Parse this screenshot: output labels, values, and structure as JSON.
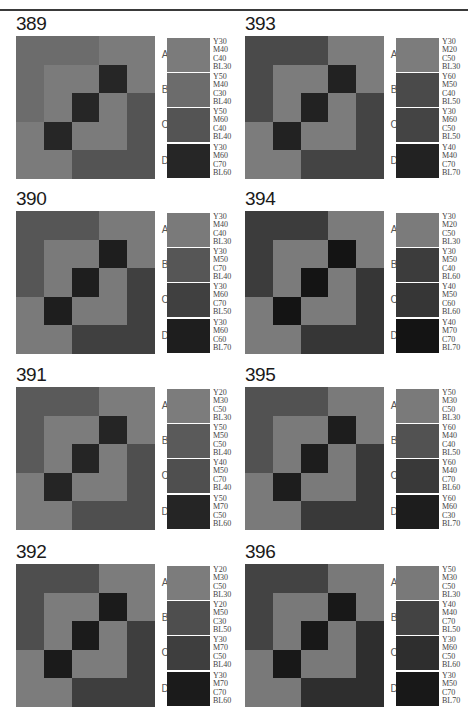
{
  "grid_pattern": [
    [
      "B",
      "B",
      "B",
      "A",
      "A"
    ],
    [
      "B",
      "A",
      "A",
      "D",
      "A"
    ],
    [
      "B",
      "A",
      "D",
      "A",
      "C"
    ],
    [
      "A",
      "D",
      "A",
      "A",
      "C"
    ],
    [
      "A",
      "A",
      "C",
      "C",
      "C"
    ]
  ],
  "panels": [
    {
      "number": "389",
      "col": 0,
      "row": 0,
      "swatches": [
        {
          "letter": "A",
          "color": "#7b7b7b",
          "spec": [
            "Y30",
            "M40",
            "C40",
            "BL30"
          ]
        },
        {
          "letter": "B",
          "color": "#6c6c6c",
          "spec": [
            "Y50",
            "M40",
            "C30",
            "BL40"
          ]
        },
        {
          "letter": "C",
          "color": "#545454",
          "spec": [
            "Y50",
            "M60",
            "C40",
            "BL40"
          ]
        },
        {
          "letter": "D",
          "color": "#262626",
          "spec": [
            "Y30",
            "M60",
            "C70",
            "BL60"
          ]
        }
      ]
    },
    {
      "number": "390",
      "col": 0,
      "row": 1,
      "swatches": [
        {
          "letter": "A",
          "color": "#7a7a7a",
          "spec": [
            "Y30",
            "M40",
            "C40",
            "BL30"
          ]
        },
        {
          "letter": "B",
          "color": "#565656",
          "spec": [
            "Y30",
            "M50",
            "C70",
            "BL40"
          ]
        },
        {
          "letter": "C",
          "color": "#404040",
          "spec": [
            "Y30",
            "M60",
            "C70",
            "BL50"
          ]
        },
        {
          "letter": "D",
          "color": "#1e1e1e",
          "spec": [
            "Y30",
            "M60",
            "C60",
            "BL70"
          ]
        }
      ]
    },
    {
      "number": "391",
      "col": 0,
      "row": 2,
      "swatches": [
        {
          "letter": "A",
          "color": "#7c7c7c",
          "spec": [
            "Y20",
            "M30",
            "C50",
            "BL30"
          ]
        },
        {
          "letter": "B",
          "color": "#5a5a5a",
          "spec": [
            "Y50",
            "M50",
            "C50",
            "BL40"
          ]
        },
        {
          "letter": "C",
          "color": "#4f4f4f",
          "spec": [
            "Y40",
            "M50",
            "C70",
            "BL40"
          ]
        },
        {
          "letter": "D",
          "color": "#252525",
          "spec": [
            "Y50",
            "M70",
            "C50",
            "BL60"
          ]
        }
      ]
    },
    {
      "number": "392",
      "col": 0,
      "row": 3,
      "swatches": [
        {
          "letter": "A",
          "color": "#7c7c7c",
          "spec": [
            "Y20",
            "M30",
            "C50",
            "BL30"
          ]
        },
        {
          "letter": "B",
          "color": "#4e4e4e",
          "spec": [
            "Y20",
            "M50",
            "C30",
            "BL50"
          ]
        },
        {
          "letter": "C",
          "color": "#3e3e3e",
          "spec": [
            "Y30",
            "M70",
            "C50",
            "BL40"
          ]
        },
        {
          "letter": "D",
          "color": "#1b1b1b",
          "spec": [
            "Y30",
            "M70",
            "C70",
            "BL60"
          ]
        }
      ]
    },
    {
      "number": "393",
      "col": 1,
      "row": 0,
      "swatches": [
        {
          "letter": "A",
          "color": "#7c7c7c",
          "spec": [
            "Y30",
            "M20",
            "C50",
            "BL30"
          ]
        },
        {
          "letter": "B",
          "color": "#4a4a4a",
          "spec": [
            "Y60",
            "M50",
            "C40",
            "BL50"
          ]
        },
        {
          "letter": "C",
          "color": "#444444",
          "spec": [
            "Y30",
            "M60",
            "C50",
            "BL50"
          ]
        },
        {
          "letter": "D",
          "color": "#222222",
          "spec": [
            "Y40",
            "M40",
            "C70",
            "BL70"
          ]
        }
      ]
    },
    {
      "number": "394",
      "col": 1,
      "row": 1,
      "swatches": [
        {
          "letter": "A",
          "color": "#7b7b7b",
          "spec": [
            "Y30",
            "M20",
            "C50",
            "BL30"
          ]
        },
        {
          "letter": "B",
          "color": "#3c3c3c",
          "spec": [
            "Y30",
            "M50",
            "C40",
            "BL60"
          ]
        },
        {
          "letter": "C",
          "color": "#363636",
          "spec": [
            "Y40",
            "M50",
            "C60",
            "BL60"
          ]
        },
        {
          "letter": "D",
          "color": "#141414",
          "spec": [
            "Y40",
            "M70",
            "C70",
            "BL70"
          ]
        }
      ]
    },
    {
      "number": "395",
      "col": 1,
      "row": 2,
      "swatches": [
        {
          "letter": "A",
          "color": "#7a7a7a",
          "spec": [
            "Y50",
            "M30",
            "C50",
            "BL30"
          ]
        },
        {
          "letter": "B",
          "color": "#525252",
          "spec": [
            "Y60",
            "M40",
            "C40",
            "BL50"
          ]
        },
        {
          "letter": "C",
          "color": "#393939",
          "spec": [
            "Y60",
            "M40",
            "C70",
            "BL60"
          ]
        },
        {
          "letter": "D",
          "color": "#1d1d1d",
          "spec": [
            "Y60",
            "M60",
            "C30",
            "BL70"
          ]
        }
      ]
    },
    {
      "number": "396",
      "col": 1,
      "row": 3,
      "swatches": [
        {
          "letter": "A",
          "color": "#797979",
          "spec": [
            "Y50",
            "M30",
            "C50",
            "BL30"
          ]
        },
        {
          "letter": "B",
          "color": "#434343",
          "spec": [
            "Y40",
            "M40",
            "C70",
            "BL50"
          ]
        },
        {
          "letter": "C",
          "color": "#2e2e2e",
          "spec": [
            "Y30",
            "M60",
            "C50",
            "BL60"
          ]
        },
        {
          "letter": "D",
          "color": "#181818",
          "spec": [
            "Y30",
            "M50",
            "C70",
            "BL70"
          ]
        }
      ]
    }
  ]
}
